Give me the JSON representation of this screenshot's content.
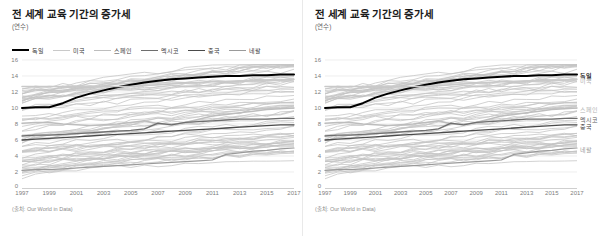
{
  "figure": {
    "title": "전 세계 교육 기간의 증가세",
    "subtitle": "(연수)",
    "source": "(출처: Our World in Data)"
  },
  "panels": [
    {
      "id": "left",
      "legend_position": "top",
      "title": "전 세계 교육 기간의 증가세",
      "subtitle": "(연수)",
      "source": "(출처: Our World in Data)"
    },
    {
      "id": "right",
      "legend_position": "right",
      "title": "전 세계 교육 기간의 증가세",
      "subtitle": "(연수)",
      "source": "(출처: Our World in Data)"
    }
  ],
  "colors": {
    "germany": "#000000",
    "usa": "#c9c9c9",
    "spain": "#bdbdbd",
    "mexico": "#6e6e6e",
    "china": "#4a4a4a",
    "nepal": "#9a9a9a",
    "background_series": "#c4c4c4",
    "grid": "#e6e6e6",
    "axis": "#cfcfcf",
    "tick_text": "#7d7d7d"
  },
  "legend": {
    "items": [
      {
        "label": "독일",
        "color": "#000000",
        "width": 2.2
      },
      {
        "label": "미국",
        "color": "#c9c9c9",
        "width": 1.8
      },
      {
        "label": "스페인",
        "color": "#bdbdbd",
        "width": 1.8
      },
      {
        "label": "멕시코",
        "color": "#6e6e6e",
        "width": 1.8
      },
      {
        "label": "중국",
        "color": "#4a4a4a",
        "width": 1.8
      },
      {
        "label": "네팔",
        "color": "#9a9a9a",
        "width": 1.8
      }
    ]
  },
  "end_labels": [
    {
      "label": "독일",
      "value": 14.2,
      "color": "#1b1b1b"
    },
    {
      "label": "미국",
      "value": 13.6,
      "color": "#b4b4b4"
    },
    {
      "label": "스페인",
      "value": 10.0,
      "color": "#b4b4b4"
    },
    {
      "label": "멕시코",
      "value": 8.7,
      "color": "#5c5c5c"
    },
    {
      "label": "중국",
      "value": 7.9,
      "color": "#3f3f3f"
    },
    {
      "label": "네팔",
      "value": 5.0,
      "color": "#9a9a9a"
    }
  ],
  "chart_data": {
    "type": "line",
    "title": "전 세계 교육 기간의 증가세",
    "subtitle": "(연수)",
    "xlabel": "",
    "ylabel": "연수",
    "xlim": [
      1997,
      2017
    ],
    "ylim": [
      0,
      16
    ],
    "yticks": [
      0,
      2,
      4,
      6,
      8,
      10,
      12,
      14,
      16
    ],
    "xticks": [
      1997,
      1999,
      2001,
      2003,
      2005,
      2007,
      2009,
      2011,
      2013,
      2015,
      2017
    ],
    "grid": true,
    "legend_position": "top (left panel) / right-of-line labels (right panel)",
    "x": [
      1997,
      1998,
      1999,
      2000,
      2001,
      2002,
      2003,
      2004,
      2005,
      2006,
      2007,
      2008,
      2009,
      2010,
      2011,
      2012,
      2013,
      2014,
      2015,
      2016,
      2017
    ],
    "highlighted_series": [
      {
        "name": "독일",
        "values": [
          10.0,
          10.1,
          10.1,
          10.6,
          11.3,
          11.8,
          12.2,
          12.6,
          12.9,
          13.2,
          13.4,
          13.6,
          13.7,
          13.8,
          13.9,
          14.0,
          14.0,
          14.1,
          14.1,
          14.2,
          14.2
        ]
      },
      {
        "name": "미국",
        "values": [
          12.7,
          12.7,
          12.7,
          12.7,
          12.7,
          12.7,
          12.7,
          12.7,
          12.7,
          12.8,
          12.9,
          13.0,
          13.1,
          13.2,
          13.3,
          13.3,
          13.4,
          13.4,
          13.5,
          13.5,
          13.6
        ]
      },
      {
        "name": "스페인",
        "values": [
          8.1,
          8.2,
          8.2,
          8.0,
          7.9,
          7.8,
          7.9,
          8.0,
          8.2,
          8.4,
          8.0,
          7.9,
          8.2,
          8.6,
          9.0,
          9.2,
          9.4,
          9.6,
          9.8,
          9.9,
          10.0
        ]
      },
      {
        "name": "멕시코",
        "values": [
          6.5,
          6.6,
          6.6,
          6.7,
          6.8,
          6.9,
          7.0,
          7.1,
          7.2,
          7.4,
          8.1,
          7.9,
          8.2,
          8.3,
          8.4,
          8.5,
          8.6,
          8.6,
          8.6,
          8.7,
          8.7
        ]
      },
      {
        "name": "중국",
        "values": [
          6.0,
          6.1,
          6.2,
          6.3,
          6.4,
          6.5,
          6.6,
          6.7,
          6.8,
          6.9,
          7.0,
          7.1,
          7.2,
          7.3,
          7.4,
          7.5,
          7.6,
          7.7,
          7.8,
          7.9,
          7.9
        ]
      },
      {
        "name": "네팔",
        "values": [
          2.2,
          2.3,
          2.3,
          2.4,
          2.5,
          2.6,
          2.7,
          2.8,
          2.9,
          3.0,
          3.1,
          3.2,
          3.3,
          3.4,
          3.5,
          4.2,
          4.4,
          4.6,
          4.7,
          4.9,
          5.0
        ]
      }
    ],
    "background_series_note": "약 60개국의 회색 추세선 (배경)"
  }
}
